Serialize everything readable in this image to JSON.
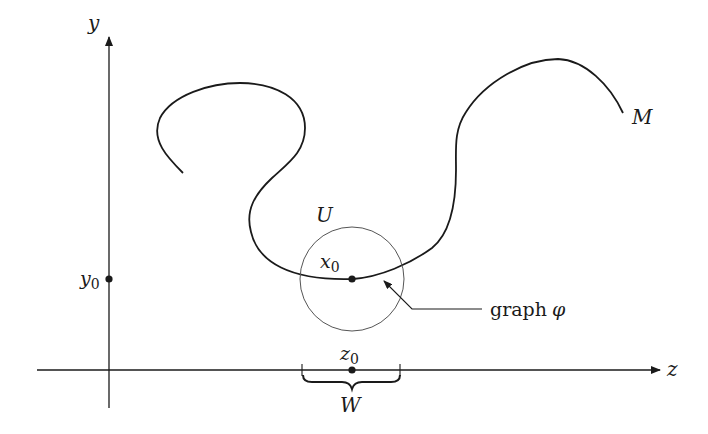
{
  "diagram": {
    "axes": {
      "y_label": "y",
      "z_label": "z",
      "y0_label": "y",
      "y0_sub": "0",
      "z0_label": "z",
      "z0_sub": "0"
    },
    "manifold_label": "M",
    "neighborhood_label": "U",
    "point_label": "x",
    "point_sub": "0",
    "interval_label": "W",
    "graph_label_text": "graph",
    "graph_label_symbol": "φ",
    "colors": {
      "ink": "#1a1a1a",
      "circle": "#555555",
      "background": "#ffffff"
    }
  }
}
